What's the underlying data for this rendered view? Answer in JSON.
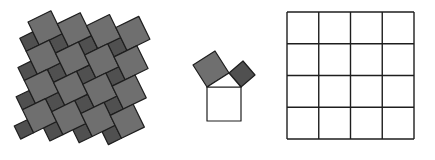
{
  "figure": {
    "colors": {
      "background": "#ffffff",
      "large_square_fill": "#6f6f6f",
      "small_square_fill": "#505050",
      "stroke": "#1e1e1e",
      "hypotenuse_square_fill": "#ffffff"
    },
    "tiling": {
      "large_side": 25.5,
      "small_side": 14.5,
      "rotation_deg": -26,
      "origin": [
        28,
        22
      ],
      "rows": 4,
      "cols": 4
    },
    "triangle": {
      "hyp_left": [
        207,
        87
      ],
      "hyp_right": [
        241,
        87
      ],
      "right_angle_vertex": [
        229,
        73
      ]
    },
    "grid": {
      "x": 287,
      "y": 12,
      "size": 127,
      "cells": 4
    }
  }
}
